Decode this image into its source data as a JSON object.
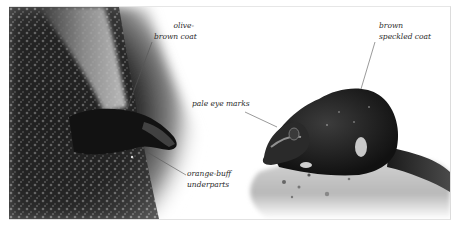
{
  "image": {
    "description": "Grayscale field-guide illustration of two small mammals with italic annotation labels",
    "colors": {
      "background": "#ffffff",
      "label_text": "#2a2a2a",
      "leader_line": "#555555",
      "frame_border": "#e0e0e0"
    }
  },
  "subjects": [
    {
      "name": "left-animal",
      "setting": "climbing down a textured tree trunk",
      "labels": [
        {
          "id": "olive-brown-coat",
          "lines": [
            "olive-",
            "brown coat"
          ]
        },
        {
          "id": "orange-buff-underparts",
          "lines": [
            "orange-buff",
            "underparts"
          ]
        }
      ]
    },
    {
      "name": "right-animal",
      "setting": "crouched on a pale rock surface with food scraps",
      "labels": [
        {
          "id": "pale-eye-marks",
          "lines": [
            "pale eye marks"
          ]
        },
        {
          "id": "brown-speckled-coat",
          "lines": [
            "brown",
            "speckled coat"
          ]
        }
      ]
    }
  ]
}
